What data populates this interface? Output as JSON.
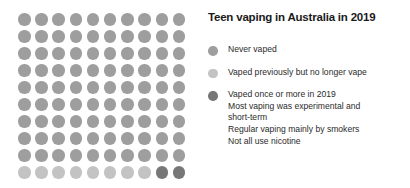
{
  "title": "Teen vaping in Australia in 2019",
  "colors": {
    "never_vaped": "#9e9e9e",
    "vaped_previously": "#c3c3c3",
    "vaped_recently": "#777777",
    "text": "#2b2b2b",
    "title_text": "#1a1a1a",
    "background": "#ffffff"
  },
  "legend": {
    "never": {
      "label": "Never vaped",
      "swatch": "dot-icon"
    },
    "former": {
      "label": "Vaped previously but no longer vape",
      "swatch": "dot-icon"
    },
    "current": {
      "label": "Vaped once or more in 2019",
      "swatch": "dot-icon",
      "notes": [
        "Most vaping was experimental and",
        "short-term",
        "Regular vaping mainly by smokers",
        "Not all use nicotine"
      ]
    }
  },
  "chart_data": {
    "type": "waffle",
    "title": "Teen vaping in Australia in 2019",
    "xlabel": "",
    "ylabel": "",
    "unit": "1 dot = 1% of teens",
    "total_dots": 100,
    "grid": {
      "rows": 10,
      "columns": 10,
      "fill_order": "row-major-top-left"
    },
    "categories": [
      "Never vaped",
      "Vaped previously but no longer vape",
      "Vaped once or more in 2019"
    ],
    "values": [
      90,
      8,
      2
    ],
    "series": [
      {
        "name": "Never vaped",
        "value": 90,
        "color": "#9e9e9e",
        "key": "c-never"
      },
      {
        "name": "Vaped previously but no longer vape",
        "value": 8,
        "color": "#c3c3c3",
        "key": "c-former"
      },
      {
        "name": "Vaped once or more in 2019",
        "value": 2,
        "color": "#777777",
        "key": "c-current"
      }
    ],
    "legend_position": "right",
    "grid_lines": false
  }
}
